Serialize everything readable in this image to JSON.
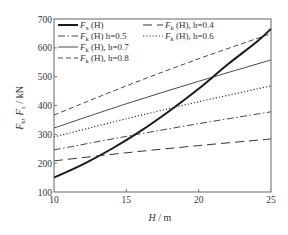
{
  "chart_data": {
    "type": "line",
    "title": "",
    "xlabel": "H / m",
    "xlabel_var": "H",
    "xlabel_unit": "m",
    "ylabel": "F_k, F_x / kN",
    "xlim": [
      10,
      25
    ],
    "ylim": [
      100,
      700
    ],
    "xticks": [
      10,
      15,
      20,
      25
    ],
    "yticks": [
      100,
      200,
      300,
      400,
      500,
      600,
      700
    ],
    "grid": false,
    "legend_position": "upper-left (two columns)",
    "series": [
      {
        "name": "F_x (H)",
        "label_main": "F",
        "label_sub": "x",
        "label_rest": " (H)",
        "style": "thick-solid",
        "color": "#1a1a1a",
        "x": [
          10,
          12,
          14,
          16,
          18,
          20,
          22,
          24,
          25
        ],
        "y": [
          150,
          196,
          250,
          312,
          382,
          458,
          542,
          620,
          666
        ]
      },
      {
        "name": "F_k (H), h=0.4",
        "label_main": "F",
        "label_sub": "k",
        "label_rest": " (H), h=0.4",
        "style": "long-dash",
        "color": "#333333",
        "x": [
          10,
          15,
          20,
          25
        ],
        "y": [
          208,
          236,
          261,
          284
        ]
      },
      {
        "name": "F_k (H), h=0.5",
        "label_main": "F",
        "label_sub": "k",
        "label_rest": " (H)  h=0.5",
        "style": "dash-dot",
        "color": "#333333",
        "x": [
          10,
          15,
          20,
          25
        ],
        "y": [
          246,
          293,
          337,
          378
        ]
      },
      {
        "name": "F_k (H), h=0.6",
        "label_main": "F",
        "label_sub": "k",
        "label_rest": " (H), h=0.6",
        "style": "dotted",
        "color": "#333333",
        "x": [
          10,
          15,
          20,
          25
        ],
        "y": [
          291,
          354,
          413,
          468
        ]
      },
      {
        "name": "F_k (H), h=0.7",
        "label_main": "F",
        "label_sub": "k",
        "label_rest": " (H), h=0.7",
        "style": "thin-solid",
        "color": "#333333",
        "x": [
          10,
          15,
          20,
          25
        ],
        "y": [
          322,
          406,
          484,
          558
        ]
      },
      {
        "name": "F_k (H), h=0.8",
        "label_main": "F",
        "label_sub": "k",
        "label_rest": " (H), h=0.8",
        "style": "dashed",
        "color": "#333333",
        "x": [
          10,
          15,
          20,
          25
        ],
        "y": [
          367,
          468,
          562,
          649
        ]
      }
    ]
  },
  "legend": {
    "column1": [
      {
        "series_index": 0,
        "text": "F",
        "sub": "x",
        "rest": " (H)"
      },
      {
        "series_index": 2,
        "text": "F",
        "sub": "k",
        "rest": " (H)  h=0.5"
      },
      {
        "series_index": 4,
        "text": "F",
        "sub": "k",
        "rest": " (H), h=0.7"
      },
      {
        "series_index": 5,
        "text": "F",
        "sub": "k",
        "rest": " (H), h=0.8"
      }
    ],
    "column2": [
      {
        "series_index": 1,
        "text": "F",
        "sub": "k",
        "rest": " (H), h=0.4"
      },
      {
        "series_index": 3,
        "text": "F",
        "sub": "k",
        "rest": " (H), h=0.6"
      }
    ]
  },
  "axes": {
    "x_tick_labels": [
      "10",
      "15",
      "20",
      "25"
    ],
    "y_tick_labels": [
      "100",
      "200",
      "300",
      "400",
      "500",
      "600",
      "700"
    ],
    "x_label": "H / m",
    "y_label_main": "F",
    "y_label_sub1": "k",
    "y_label_mid": ", F",
    "y_label_sub2": "x",
    "y_label_unit": " / kN"
  }
}
